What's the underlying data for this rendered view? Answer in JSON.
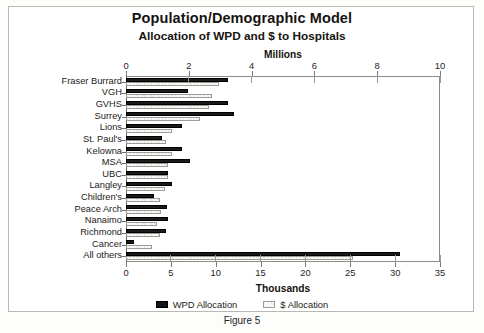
{
  "figure": {
    "caption": "Figure 5",
    "title": "Population/Demographic Model",
    "subtitle": "Allocation of WPD and $ to Hospitals"
  },
  "axes": {
    "top_title": "Millions",
    "bottom_title": "Thousands",
    "top_ticks": [
      "0",
      "2",
      "4",
      "6",
      "8",
      "10"
    ],
    "bottom_ticks": [
      "0",
      "5",
      "10",
      "15",
      "20",
      "25",
      "30",
      "35"
    ]
  },
  "legend": {
    "items": [
      {
        "label": "WPD Allocation",
        "key": "wpd",
        "color": "#141414"
      },
      {
        "label": "$ Allocation",
        "key": "dollar",
        "color": "#e6e6e3"
      }
    ]
  },
  "chart_data": {
    "type": "bar",
    "orientation": "horizontal",
    "title": "Population/Demographic Model",
    "subtitle": "Allocation of WPD and $ to Hospitals",
    "xlabel": "Millions",
    "secondary_xlabel": "Thousands",
    "ylabel": "",
    "xlim": [
      0,
      10
    ],
    "secondary_xlim": [
      0,
      35
    ],
    "grid": false,
    "legend_position": "bottom",
    "note": "All rows except 'All others' are read on the top 'Millions' axis; the 'All others' row is read on the bottom 'Thousands' axis.",
    "categories": [
      "Fraser Burrard",
      "VGH",
      "GVHS",
      "Surrey",
      "Lions",
      "St. Paul's",
      "Kelowna",
      "MSA",
      "UBC",
      "Langley",
      "Children's",
      "Peace Arch",
      "Nanaimo",
      "Richmond",
      "Cancer",
      "All others"
    ],
    "series": [
      {
        "name": "WPD Allocation",
        "unit": "Millions",
        "values": [
          3.25,
          1.97,
          3.25,
          3.44,
          1.78,
          1.15,
          1.78,
          2.04,
          1.34,
          1.46,
          0.89,
          1.31,
          1.34,
          1.27,
          0.25,
          null
        ]
      },
      {
        "name": "$ Allocation",
        "unit": "Millions",
        "values": [
          2.96,
          2.74,
          2.64,
          2.36,
          1.46,
          1.27,
          1.46,
          1.34,
          1.34,
          1.24,
          1.08,
          1.11,
          0.99,
          1.08,
          0.83,
          null
        ]
      },
      {
        "name": "WPD Allocation (Thousands axis)",
        "unit": "Thousands",
        "values": [
          null,
          null,
          null,
          null,
          null,
          null,
          null,
          null,
          null,
          null,
          null,
          null,
          null,
          null,
          null,
          30.5
        ]
      },
      {
        "name": "$ Allocation (Thousands axis)",
        "unit": "Thousands",
        "values": [
          null,
          null,
          null,
          null,
          null,
          null,
          null,
          null,
          null,
          null,
          null,
          null,
          null,
          null,
          null,
          25.3
        ]
      }
    ]
  }
}
